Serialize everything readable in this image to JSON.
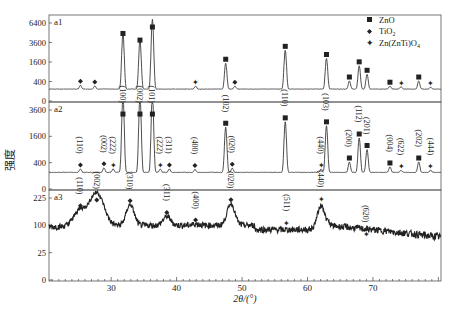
{
  "chart_data": {
    "type": "line",
    "title": "",
    "xlabel": "2θ/(°)",
    "ylabel": "强度",
    "xlim": [
      20.5,
      80.4
    ],
    "x_ticks": [
      30,
      40,
      50,
      60,
      70
    ],
    "grid": false,
    "legend_position": "upper right (panel a1)",
    "legend": [
      {
        "symbol": "square",
        "label": "ZnO"
      },
      {
        "symbol": "diamond",
        "label": "TiO2"
      },
      {
        "symbol": "star",
        "label": "Zn(ZnTi)O4"
      }
    ],
    "panels": [
      {
        "name": "a1",
        "y_ticks": [
          0,
          400,
          1600,
          3600,
          6400
        ],
        "y_scale": "sqrt",
        "baseline": 150,
        "peaks": [
          {
            "x": 25.3,
            "y": 260,
            "phase": "TiO2"
          },
          {
            "x": 27.5,
            "y": 240,
            "phase": "TiO2"
          },
          {
            "x": 31.8,
            "y": 4800,
            "phase": "ZnO"
          },
          {
            "x": 34.4,
            "y": 3900,
            "phase": "ZnO"
          },
          {
            "x": 36.3,
            "y": 7000,
            "phase": "ZnO"
          },
          {
            "x": 42.9,
            "y": 230,
            "phase": "Zn(ZnTi)O4"
          },
          {
            "x": 47.5,
            "y": 1500,
            "phase": "ZnO"
          },
          {
            "x": 48.9,
            "y": 230,
            "phase": "TiO2"
          },
          {
            "x": 56.6,
            "y": 2700,
            "phase": "ZnO"
          },
          {
            "x": 62.9,
            "y": 1900,
            "phase": "ZnO"
          },
          {
            "x": 66.4,
            "y": 420,
            "phase": "ZnO"
          },
          {
            "x": 67.9,
            "y": 1300,
            "phase": "ZnO"
          },
          {
            "x": 69.1,
            "y": 750,
            "phase": "ZnO"
          },
          {
            "x": 72.6,
            "y": 230,
            "phase": "ZnO"
          },
          {
            "x": 74.3,
            "y": 210,
            "phase": "Zn(ZnTi)O4"
          },
          {
            "x": 77.0,
            "y": 420,
            "phase": "ZnO"
          },
          {
            "x": 78.8,
            "y": 200,
            "phase": "Zn(ZnTi)O4"
          }
        ]
      },
      {
        "name": "a2",
        "y_ticks": [
          0,
          400,
          1600,
          3600
        ],
        "y_scale": "sqrt",
        "baseline": 160,
        "peaks": [
          {
            "x": 25.3,
            "y": 230,
            "phase": "TiO2",
            "hkl": "(110)"
          },
          {
            "x": 28.9,
            "y": 260,
            "phase": "TiO2",
            "hkl": "(002)"
          },
          {
            "x": 30.3,
            "y": 230,
            "phase": "Zn(ZnTi)O4",
            "hkl": "(222)"
          },
          {
            "x": 31.8,
            "y": 5000,
            "phase": "ZnO",
            "hkl": "(100)"
          },
          {
            "x": 34.4,
            "y": 5000,
            "phase": "ZnO",
            "hkl": "(002)"
          },
          {
            "x": 36.3,
            "y": 5000,
            "phase": "ZnO",
            "hkl": "(101)"
          },
          {
            "x": 37.5,
            "y": 230,
            "phase": "Zn(ZnTi)O4",
            "hkl": "(222)"
          },
          {
            "x": 38.9,
            "y": 230,
            "phase": "TiO2",
            "hkl": "(311)"
          },
          {
            "x": 42.8,
            "y": 220,
            "phase": "TiO2",
            "hkl": "(400)"
          },
          {
            "x": 47.5,
            "y": 2200,
            "phase": "ZnO",
            "hkl": "(102)"
          },
          {
            "x": 48.5,
            "y": 250,
            "phase": "TiO2",
            "hkl": "(020)"
          },
          {
            "x": 56.6,
            "y": 2600,
            "phase": "ZnO",
            "hkl": "(110)"
          },
          {
            "x": 62.1,
            "y": 230,
            "phase": "Zn(ZnTi)O4",
            "hkl": "(440)"
          },
          {
            "x": 62.9,
            "y": 2300,
            "phase": "ZnO",
            "hkl": "(103)"
          },
          {
            "x": 66.4,
            "y": 420,
            "phase": "ZnO",
            "hkl": "(200)"
          },
          {
            "x": 67.9,
            "y": 1500,
            "phase": "ZnO",
            "hkl": "(112)"
          },
          {
            "x": 69.1,
            "y": 900,
            "phase": "ZnO",
            "hkl": "(201)"
          },
          {
            "x": 72.6,
            "y": 280,
            "phase": "ZnO",
            "hkl": "(004)"
          },
          {
            "x": 74.3,
            "y": 200,
            "phase": "Zn(ZnTi)O4",
            "hkl": "(622)"
          },
          {
            "x": 77.0,
            "y": 420,
            "phase": "ZnO",
            "hkl": "(202)"
          },
          {
            "x": 78.8,
            "y": 200,
            "phase": "Zn(ZnTi)O4",
            "hkl": "(444)"
          }
        ]
      },
      {
        "name": "a3",
        "y_ticks": [
          0,
          25,
          100,
          225
        ],
        "y_scale": "sqrt",
        "baseline": 100,
        "peaks": [
          {
            "x": 25.3,
            "y": 165,
            "phase": "TiO2",
            "hkl": "(110)"
          },
          {
            "x": 27.8,
            "y": 255,
            "phase": "TiO2",
            "hkl": "(002)"
          },
          {
            "x": 32.9,
            "y": 190,
            "phase": "TiO2",
            "hkl": "(310)"
          },
          {
            "x": 38.5,
            "y": 135,
            "phase": "TiO2",
            "hkl": "(311)"
          },
          {
            "x": 42.9,
            "y": 105,
            "phase": "TiO2",
            "hkl": "(400)"
          },
          {
            "x": 48.3,
            "y": 195,
            "phase": "TiO2",
            "hkl": "(020)"
          },
          {
            "x": 56.8,
            "y": 95,
            "phase": "Zn(ZnTi)O4",
            "hkl": "(511)"
          },
          {
            "x": 62.1,
            "y": 200,
            "phase": "Zn(ZnTi)O4",
            "hkl": "(440)"
          },
          {
            "x": 69.0,
            "y": 60,
            "phase": "Zn(ZnTi)O4",
            "hkl": "(620)"
          }
        ]
      }
    ]
  },
  "legend_labels": {
    "zno": "ZnO",
    "tio2": "TiO",
    "tio2_sub": "2",
    "znzntio4": "Zn(ZnTi)O",
    "znzntio4_sub": "4"
  },
  "panel_labels": {
    "a1": "a1",
    "a2": "a2",
    "a3": "a3"
  },
  "axis": {
    "ylabel": "强度",
    "xlabel": "2θ/(°)"
  },
  "colors": {
    "line": "#222222",
    "axis": "#444444",
    "background": "#ffffff"
  }
}
